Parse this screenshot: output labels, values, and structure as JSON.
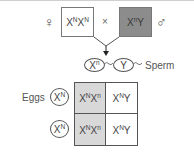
{
  "cross": {
    "female_symbol": "♀",
    "male_symbol": "♂",
    "times": "×",
    "female_genotype": {
      "base1": "X",
      "sup1": "N",
      "base2": "X",
      "sup2": "N"
    },
    "male_genotype": {
      "base1": "X",
      "sup1": "n",
      "base2": "Y"
    }
  },
  "sperm": {
    "label": "Sperm",
    "gametes": [
      {
        "base": "X",
        "sup": "n"
      },
      {
        "base": "Y",
        "sup": ""
      }
    ]
  },
  "eggs": {
    "label": "Eggs",
    "gametes": [
      {
        "base": "X",
        "sup": "N"
      },
      {
        "base": "X",
        "sup": "N"
      }
    ]
  },
  "punnett": {
    "cells": [
      {
        "b1": "X",
        "s1": "N",
        "b2": "X",
        "s2": "n",
        "shaded": true
      },
      {
        "b1": "X",
        "s1": "N",
        "b2": "Y",
        "s2": "",
        "shaded": false
      },
      {
        "b1": "X",
        "s1": "N",
        "b2": "X",
        "s2": "n",
        "shaded": true
      },
      {
        "b1": "X",
        "s1": "N",
        "b2": "Y",
        "s2": "",
        "shaded": false
      }
    ]
  },
  "colors": {
    "male_box_fill": "#8c8c8c",
    "carrier_cell_fill": "#d8d8d8",
    "line": "#555555"
  }
}
